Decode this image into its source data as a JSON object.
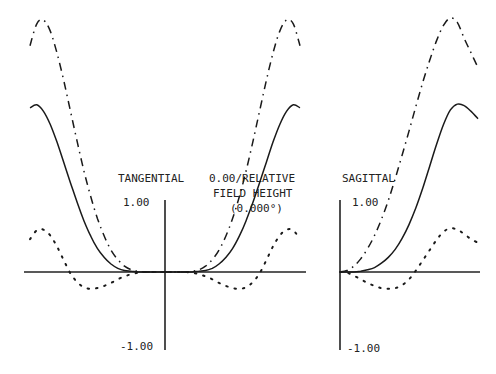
{
  "chart_data": [
    {
      "type": "line",
      "title": "TANGENTIAL",
      "field_label": [
        "0.00/RELATIVE",
        "FIELD HEIGHT",
        "(0.000°)"
      ],
      "xlabel": "",
      "ylabel": "",
      "x_range": [
        -1,
        1
      ],
      "ylim": [
        -1.0,
        1.0
      ],
      "ytick_labels": [
        "1.00",
        "-1.00"
      ],
      "grid": false,
      "legend": "none",
      "x": [
        -1.0,
        -0.95,
        -0.9,
        -0.85,
        -0.8,
        -0.75,
        -0.7,
        -0.65,
        -0.6,
        -0.55,
        -0.5,
        -0.45,
        -0.4,
        -0.35,
        -0.3,
        -0.25,
        -0.2,
        -0.15,
        -0.1,
        -0.05,
        0.0,
        0.05,
        0.1,
        0.15,
        0.2,
        0.25,
        0.3,
        0.35,
        0.4,
        0.45,
        0.5,
        0.55,
        0.6,
        0.65,
        0.7,
        0.75,
        0.8,
        0.85,
        0.9,
        0.95,
        1.0
      ],
      "series": [
        {
          "name": "solid",
          "style": "solid",
          "values": [
            2.25,
            2.29,
            2.2,
            2.02,
            1.78,
            1.5,
            1.22,
            0.95,
            0.7,
            0.49,
            0.32,
            0.2,
            0.11,
            0.05,
            0.02,
            0.01,
            0.0,
            0.0,
            0.0,
            0.0,
            0.0,
            0.0,
            0.0,
            0.0,
            0.0,
            0.01,
            0.02,
            0.05,
            0.11,
            0.2,
            0.32,
            0.49,
            0.7,
            0.95,
            1.22,
            1.5,
            1.78,
            2.02,
            2.2,
            2.29,
            2.25
          ]
        },
        {
          "name": "dash-dot",
          "style": "dashdot",
          "values": [
            3.1,
            3.4,
            3.45,
            3.3,
            3.0,
            2.62,
            2.2,
            1.78,
            1.38,
            1.03,
            0.73,
            0.49,
            0.3,
            0.17,
            0.08,
            0.03,
            0.01,
            0.0,
            0.0,
            0.0,
            0.0,
            0.0,
            0.0,
            0.0,
            0.01,
            0.03,
            0.08,
            0.17,
            0.3,
            0.49,
            0.73,
            1.03,
            1.38,
            1.78,
            2.2,
            2.62,
            3.0,
            3.3,
            3.45,
            3.4,
            3.1
          ]
        },
        {
          "name": "dotted",
          "style": "dotted",
          "values": [
            0.45,
            0.57,
            0.58,
            0.5,
            0.35,
            0.16,
            -0.02,
            -0.14,
            -0.21,
            -0.23,
            -0.22,
            -0.19,
            -0.15,
            -0.1,
            -0.06,
            -0.03,
            -0.01,
            0.0,
            0.0,
            0.0,
            0.0,
            0.0,
            0.0,
            0.0,
            -0.01,
            -0.03,
            -0.06,
            -0.1,
            -0.15,
            -0.19,
            -0.22,
            -0.23,
            -0.21,
            -0.14,
            -0.02,
            0.16,
            0.35,
            0.5,
            0.58,
            0.57,
            0.45
          ]
        }
      ]
    },
    {
      "type": "line",
      "title": "SAGITTAL",
      "xlabel": "",
      "ylabel": "",
      "x_range": [
        0,
        1
      ],
      "ylim": [
        -1.0,
        1.0
      ],
      "ytick_labels": [
        "1.00",
        "-1.00"
      ],
      "grid": false,
      "legend": "none",
      "x": [
        0.0,
        0.05,
        0.1,
        0.15,
        0.2,
        0.25,
        0.3,
        0.35,
        0.4,
        0.45,
        0.5,
        0.55,
        0.6,
        0.65,
        0.7,
        0.75,
        0.8,
        0.85,
        0.9,
        0.95,
        1.0
      ],
      "series": [
        {
          "name": "solid",
          "style": "solid",
          "values": [
            0.0,
            0.0,
            0.0,
            0.01,
            0.03,
            0.06,
            0.12,
            0.2,
            0.31,
            0.46,
            0.65,
            0.88,
            1.15,
            1.45,
            1.75,
            2.02,
            2.22,
            2.3,
            2.28,
            2.2,
            2.1
          ]
        },
        {
          "name": "dash-dot",
          "style": "dashdot",
          "values": [
            0.0,
            0.02,
            0.08,
            0.18,
            0.32,
            0.5,
            0.72,
            0.98,
            1.28,
            1.6,
            1.93,
            2.27,
            2.6,
            2.9,
            3.17,
            3.38,
            3.48,
            3.42,
            3.2,
            3.0,
            2.8
          ]
        },
        {
          "name": "dotted",
          "style": "dotted",
          "values": [
            0.0,
            -0.01,
            -0.05,
            -0.1,
            -0.15,
            -0.19,
            -0.22,
            -0.23,
            -0.22,
            -0.18,
            -0.1,
            0.02,
            0.16,
            0.3,
            0.44,
            0.55,
            0.6,
            0.58,
            0.52,
            0.45,
            0.4
          ]
        }
      ]
    }
  ]
}
